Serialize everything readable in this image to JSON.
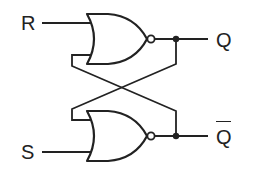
{
  "diagram": {
    "type": "logic-circuit",
    "colors": {
      "stroke": "#222222",
      "background": "#ffffff"
    },
    "inputs": [
      {
        "id": "R",
        "label": "R"
      },
      {
        "id": "S",
        "label": "S"
      }
    ],
    "outputs": [
      {
        "id": "Q",
        "label": "Q"
      },
      {
        "id": "Q_bar",
        "label": "Q",
        "overline": true
      }
    ],
    "gates": [
      {
        "id": "nor-top",
        "kind": "NOR",
        "inputs": [
          "R",
          "Q_bar"
        ],
        "output": "Q"
      },
      {
        "id": "nor-bottom",
        "kind": "NOR",
        "inputs": [
          "Q",
          "S"
        ],
        "output": "Q_bar"
      }
    ],
    "connections": [
      "Q output feeds back to bottom NOR upper input (cross-coupled)",
      "Q_bar output feeds back to top NOR lower input (cross-coupled)"
    ]
  }
}
